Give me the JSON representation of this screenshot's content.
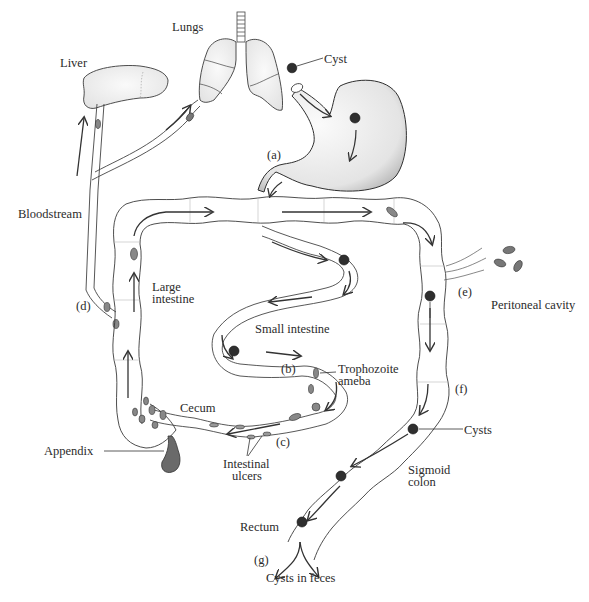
{
  "diagram": {
    "organs": {
      "liver": "Liver",
      "lungs": "Lungs",
      "cyst": "Cyst",
      "bloodstream": "Bloodstream",
      "large_intestine_1": "Large",
      "large_intestine_2": "intestine",
      "small_intestine": "Small intestine",
      "trophozoite_1": "Trophozoite",
      "trophozoite_2": "ameba",
      "cecum": "Cecum",
      "appendix": "Appendix",
      "ulcers_1": "Intestinal",
      "ulcers_2": "ulcers",
      "peritoneal": "Peritoneal cavity",
      "cysts": "Cysts",
      "sigmoid_1": "Sigmoid",
      "sigmoid_2": "colon",
      "rectum": "Rectum",
      "feces": "Cysts in feces"
    },
    "stages": {
      "a": "(a)",
      "b": "(b)",
      "c": "(c)",
      "d": "(d)",
      "e": "(e)",
      "f": "(f)",
      "g": "(g)"
    },
    "colors": {
      "outline": "#3a3a3a",
      "cyst_fill": "#2f2f2f",
      "trophozoite_fill": "#8a8a8a",
      "organ_stipple": "#e9e9e9"
    }
  }
}
